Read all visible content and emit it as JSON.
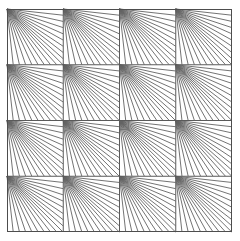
{
  "figure": {
    "title": "",
    "caption": "",
    "canvas": {
      "width": 240,
      "height": 241
    },
    "background_color": "#ffffff"
  },
  "chart_data": {
    "type": "diagram",
    "title": "",
    "subtitle": "",
    "xlabel": "",
    "ylabel": "",
    "grid": {
      "rows": 4,
      "cols": 4,
      "outer_left": 7,
      "outer_top": 9,
      "outer_right": 232,
      "outer_bottom": 232,
      "cell_width": 56.25,
      "cell_height": 55.75,
      "border_color": "#4d4d4d",
      "border_width": 1,
      "grid_line_color": "#5a5a5a",
      "grid_line_width": 1,
      "fill_color": "#ffffff"
    },
    "tile_pattern": {
      "name": "corner-fan",
      "origin_corner": "top-left",
      "line_count": 17,
      "endpoint_distribution": "uniform along bottom edge then right edge, traversed from bottom-left to top-right",
      "line_color": "#636363",
      "line_width": 0.9,
      "legend": "none",
      "grid_on": true
    },
    "x": [
      0,
      1,
      2,
      3
    ],
    "y": [
      0,
      1,
      2,
      3
    ],
    "series": [
      {
        "name": "tile-fan-row-0",
        "values": [
          17,
          17,
          17,
          17
        ]
      },
      {
        "name": "tile-fan-row-1",
        "values": [
          17,
          17,
          17,
          17
        ]
      },
      {
        "name": "tile-fan-row-2",
        "values": [
          17,
          17,
          17,
          17
        ]
      },
      {
        "name": "tile-fan-row-3",
        "values": [
          17,
          17,
          17,
          17
        ]
      }
    ],
    "legend_position": "none",
    "annotations": []
  }
}
